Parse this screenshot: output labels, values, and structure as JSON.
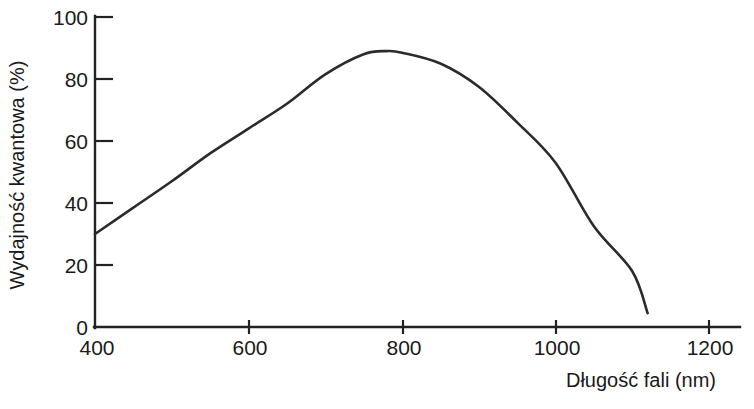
{
  "chart_data": {
    "type": "line",
    "title": "",
    "xlabel": "Długość fali (nm)",
    "ylabel": "Wydajność kwantowa (%)",
    "xlim": [
      400,
      1200
    ],
    "ylim": [
      0,
      100
    ],
    "grid": false,
    "legend": null,
    "x_ticks": [
      400,
      600,
      800,
      1000,
      1200
    ],
    "x_tick_labels": [
      "400",
      "600",
      "800",
      "1000",
      "1200"
    ],
    "y_ticks": [
      0,
      20,
      40,
      60,
      80,
      100
    ],
    "y_tick_labels": [
      "0",
      "20",
      "40",
      "60",
      "80",
      "100"
    ],
    "series": [
      {
        "name": "Wydajność kwantowa",
        "color": "#2b2b2b",
        "x": [
          400,
          450,
          500,
          550,
          600,
          650,
          700,
          750,
          780,
          800,
          850,
          900,
          950,
          1000,
          1050,
          1100,
          1120
        ],
        "values": [
          30,
          38.5,
          47,
          56,
          64,
          72,
          81.5,
          88,
          89,
          88.5,
          85,
          77.5,
          66,
          53,
          32.5,
          18,
          4.5
        ]
      }
    ],
    "annotations": {
      "peak_wavelength_nm": 780,
      "peak_value_percent": 89
    }
  },
  "axes": {
    "x_axis_name": "wavelength-axis",
    "y_axis_name": "quantum-efficiency-axis"
  }
}
